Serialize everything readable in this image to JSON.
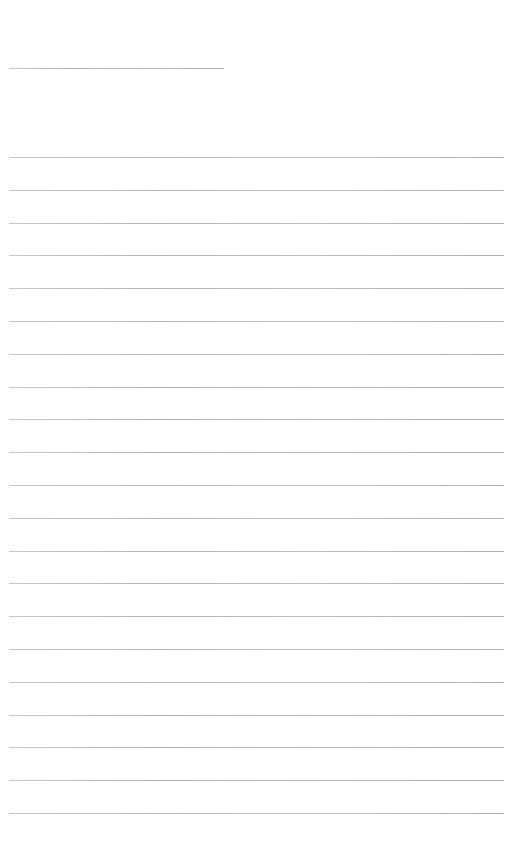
{
  "page": {
    "type": "lined-paper",
    "background_color": "#ffffff",
    "rule_color": "#b8b8b8"
  },
  "title_line": {
    "x": 9,
    "y": 68,
    "width": 215
  },
  "ruled_lines": {
    "count": 21,
    "x": 9,
    "width": 495,
    "first_y": 157,
    "spacing": 32.8
  }
}
